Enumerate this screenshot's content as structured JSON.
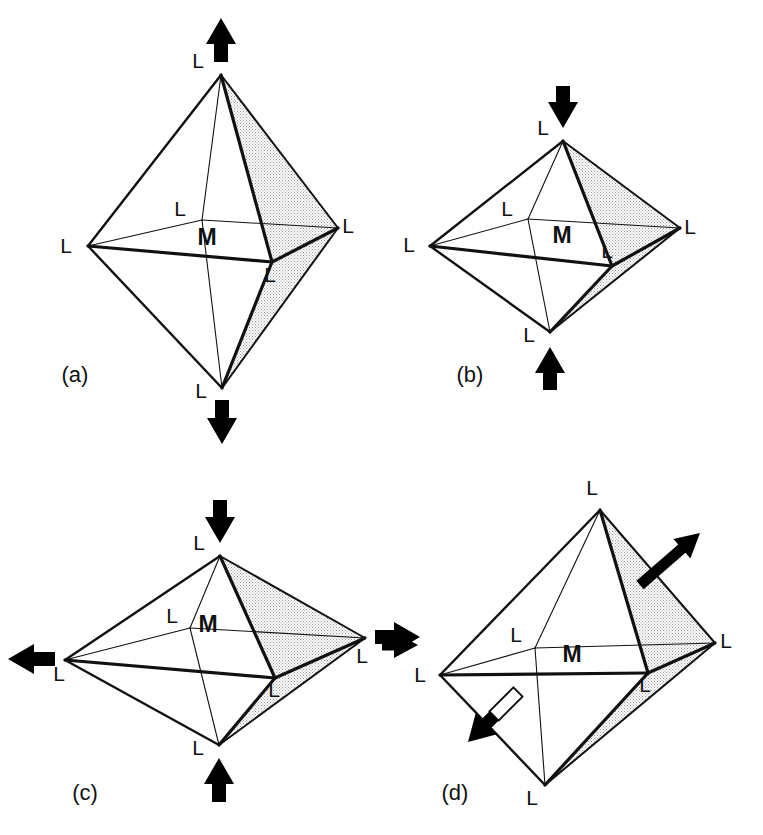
{
  "figure": {
    "width": 763,
    "height": 835,
    "background_color": "#ffffff",
    "line_color": "#111111",
    "shade_fill": "#d6d6d6",
    "arrow_color": "#000000"
  },
  "labels": {
    "ligand": "L",
    "metal": "M"
  },
  "panels": [
    {
      "id": "a",
      "caption": "(a)",
      "caption_x": 75,
      "caption_y": 382,
      "distortion": "tetragonal elongation",
      "center": {
        "x": 207,
        "y": 245,
        "label": "M"
      },
      "vertices": {
        "top": {
          "x": 221,
          "y": 75,
          "label": "L",
          "lx": 198,
          "ly": 68
        },
        "bottom": {
          "x": 222,
          "y": 388,
          "label": "L",
          "lx": 201,
          "ly": 398
        },
        "left": {
          "x": 88,
          "y": 246,
          "label": "L",
          "lx": 66,
          "ly": 253
        },
        "right": {
          "x": 338,
          "y": 228,
          "label": "L",
          "lx": 348,
          "ly": 233
        },
        "back": {
          "x": 202,
          "y": 220,
          "label": "L",
          "lx": 180,
          "ly": 216
        },
        "front": {
          "x": 272,
          "y": 262,
          "label": "L",
          "lx": 270,
          "ly": 282
        }
      },
      "arrows": [
        {
          "name": "top-arrow-up",
          "direction": "up",
          "x1": 221,
          "y1": 62,
          "x2": 221,
          "y2": 18
        },
        {
          "name": "bottom-arrow-down",
          "direction": "down",
          "x1": 222,
          "y1": 400,
          "x2": 222,
          "y2": 444
        }
      ]
    },
    {
      "id": "b",
      "caption": "(b)",
      "caption_x": 470,
      "caption_y": 382,
      "distortion": "tetragonal compression",
      "center": {
        "x": 562,
        "y": 243,
        "label": "M"
      },
      "vertices": {
        "top": {
          "x": 563,
          "y": 141,
          "label": "L",
          "lx": 543,
          "ly": 135
        },
        "bottom": {
          "x": 550,
          "y": 332,
          "label": "L",
          "lx": 529,
          "ly": 342
        },
        "left": {
          "x": 430,
          "y": 246,
          "label": "L",
          "lx": 409,
          "ly": 252
        },
        "right": {
          "x": 680,
          "y": 228,
          "label": "L",
          "lx": 690,
          "ly": 234
        },
        "back": {
          "x": 528,
          "y": 219,
          "label": "L",
          "lx": 507,
          "ly": 216
        },
        "front": {
          "x": 612,
          "y": 266,
          "label": "L",
          "lx": 607,
          "ly": 258
        }
      },
      "arrows": [
        {
          "name": "top-arrow-down",
          "direction": "down",
          "x1": 563,
          "y1": 86,
          "x2": 563,
          "y2": 128
        },
        {
          "name": "bottom-arrow-up",
          "direction": "up",
          "x1": 550,
          "y1": 390,
          "x2": 550,
          "y2": 347
        }
      ]
    },
    {
      "id": "c",
      "caption": "(c)",
      "caption_x": 85,
      "caption_y": 800,
      "distortion": "rhombic distortion",
      "center": {
        "x": 208,
        "y": 632,
        "label": "M"
      },
      "vertices": {
        "top": {
          "x": 220,
          "y": 556,
          "label": "L",
          "lx": 199,
          "ly": 550
        },
        "bottom": {
          "x": 219,
          "y": 745,
          "label": "L",
          "lx": 198,
          "ly": 755
        },
        "left": {
          "x": 65,
          "y": 660,
          "label": "L",
          "lx": 59,
          "ly": 681
        },
        "right": {
          "x": 365,
          "y": 638,
          "label": "L",
          "lx": 362,
          "ly": 663
        },
        "back": {
          "x": 190,
          "y": 628,
          "label": "L",
          "lx": 172,
          "ly": 623
        },
        "front": {
          "x": 275,
          "y": 678,
          "label": "L",
          "lx": 274,
          "ly": 697
        }
      },
      "arrows": [
        {
          "name": "top-arrow-down",
          "direction": "down",
          "x1": 220,
          "y1": 500,
          "x2": 220,
          "y2": 543
        },
        {
          "name": "bottom-arrow-up",
          "direction": "up",
          "x1": 219,
          "y1": 802,
          "x2": 219,
          "y2": 758
        },
        {
          "name": "left-arrow-left",
          "direction": "left",
          "x1": 55,
          "y1": 659,
          "x2": 8,
          "y2": 659
        },
        {
          "name": "right-arrow-right",
          "direction": "right",
          "x1": 375,
          "y1": 637,
          "x2": 420,
          "y2": 637
        }
      ]
    },
    {
      "id": "d",
      "caption": "(d)",
      "caption_x": 455,
      "caption_y": 800,
      "distortion": "shear / trigonal distortion",
      "center": {
        "x": 572,
        "y": 662,
        "label": "M"
      },
      "vertices": {
        "top": {
          "x": 600,
          "y": 510,
          "label": "L",
          "lx": 592,
          "ly": 495
        },
        "bottom": {
          "x": 545,
          "y": 785,
          "label": "L",
          "lx": 532,
          "ly": 805
        },
        "left": {
          "x": 440,
          "y": 675,
          "label": "L",
          "lx": 420,
          "ly": 682
        },
        "right": {
          "x": 715,
          "y": 643,
          "label": "L",
          "lx": 726,
          "ly": 648
        },
        "back": {
          "x": 535,
          "y": 648,
          "label": "L",
          "lx": 516,
          "ly": 642
        },
        "front": {
          "x": 648,
          "y": 673,
          "label": "L",
          "lx": 645,
          "ly": 692
        }
      },
      "arrows": [
        {
          "name": "upper-right-arrow",
          "direction": "up-right",
          "x1": 640,
          "y1": 585,
          "x2": 700,
          "y2": 533
        },
        {
          "name": "lower-left-arrow",
          "direction": "down-left",
          "x1": 518,
          "y1": 692,
          "x2": 468,
          "y2": 742
        },
        {
          "name": "left-edge-arrow",
          "direction": "right",
          "x1": 382,
          "y1": 645,
          "x2": 418,
          "y2": 645
        }
      ]
    }
  ]
}
